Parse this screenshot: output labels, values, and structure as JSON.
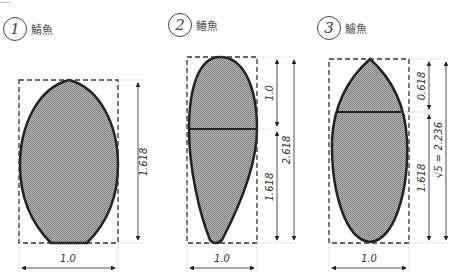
{
  "figures": [
    {
      "number": "1",
      "name": "鯖魚",
      "width_label": "1.0",
      "height_labels": [
        "1.618"
      ]
    },
    {
      "number": "2",
      "name": "鰆魚",
      "width_label": "1.0",
      "height_labels": [
        "1.0",
        "1.618",
        "2.618"
      ]
    },
    {
      "number": "3",
      "name": "鱸魚",
      "width_label": "1.0",
      "height_labels": [
        "0.618",
        "1.618",
        "√5 = 2.236"
      ]
    }
  ],
  "colors": {
    "fill": "#9a9a9a",
    "outline": "#222222",
    "dash": "#333333"
  }
}
